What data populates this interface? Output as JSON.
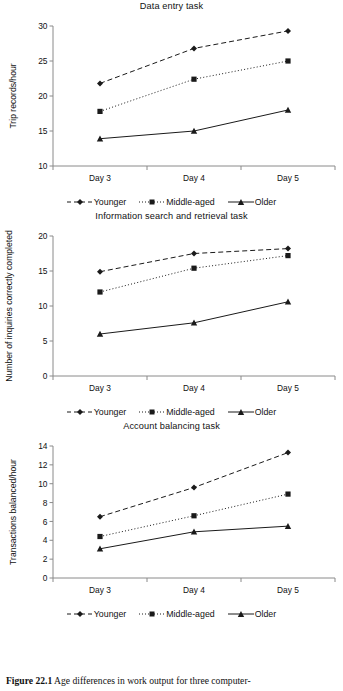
{
  "figure": {
    "caption_label": "Figure 22.1",
    "caption_text": "Age differences in work output for three computer-"
  },
  "legend": {
    "items": [
      {
        "label": "Younger",
        "marker": "diamond-marker",
        "dash": "dashed",
        "color": "#1a1a1a"
      },
      {
        "label": "Middle-aged",
        "marker": "square-marker",
        "dash": "dotted",
        "color": "#1a1a1a"
      },
      {
        "label": "Older",
        "marker": "triangle-marker",
        "dash": "solid",
        "color": "#1a1a1a"
      }
    ]
  },
  "chart_data": [
    {
      "type": "line",
      "title": "Data entry task",
      "xlabel": "",
      "ylabel": "Trip records/hour",
      "categories": [
        "Day 3",
        "Day 4",
        "Day 5"
      ],
      "ylim": [
        10,
        30
      ],
      "yticks": [
        10,
        15,
        20,
        25,
        30
      ],
      "grid": false,
      "legend_position": "bottom",
      "series": [
        {
          "name": "Younger",
          "values": [
            21.8,
            26.8,
            29.3
          ]
        },
        {
          "name": "Middle-aged",
          "values": [
            17.8,
            22.4,
            25.0
          ]
        },
        {
          "name": "Older",
          "values": [
            13.9,
            15.0,
            18.0
          ]
        }
      ]
    },
    {
      "type": "line",
      "title": "Information search and retrieval task",
      "xlabel": "",
      "ylabel": "Number of inquiries correctly completed",
      "categories": [
        "Day 3",
        "Day 4",
        "Day 5"
      ],
      "ylim": [
        0,
        20
      ],
      "yticks": [
        0,
        5,
        10,
        15,
        20
      ],
      "grid": false,
      "legend_position": "bottom",
      "series": [
        {
          "name": "Younger",
          "values": [
            14.9,
            17.5,
            18.2
          ]
        },
        {
          "name": "Middle-aged",
          "values": [
            12.0,
            15.4,
            17.2
          ]
        },
        {
          "name": "Older",
          "values": [
            6.0,
            7.6,
            10.6
          ]
        }
      ]
    },
    {
      "type": "line",
      "title": "Account balancing task",
      "xlabel": "",
      "ylabel": "Transactions balanced/hour",
      "categories": [
        "Day 3",
        "Day 4",
        "Day 5"
      ],
      "ylim": [
        0,
        14
      ],
      "yticks": [
        0,
        2,
        4,
        6,
        8,
        10,
        12,
        14
      ],
      "grid": false,
      "legend_position": "bottom",
      "series": [
        {
          "name": "Younger",
          "values": [
            6.5,
            9.6,
            13.3
          ]
        },
        {
          "name": "Middle-aged",
          "values": [
            4.4,
            6.6,
            8.9
          ]
        },
        {
          "name": "Older",
          "values": [
            3.1,
            4.9,
            5.5
          ]
        }
      ]
    }
  ]
}
